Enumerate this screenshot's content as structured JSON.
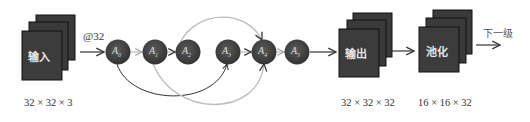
{
  "input_block": {
    "label": "输入",
    "dims": "32 × 32 × 3"
  },
  "input_arrow": {
    "label": "@32"
  },
  "nodes": [
    {
      "id": "A0",
      "base": "A",
      "sub": "0"
    },
    {
      "id": "A1",
      "base": "A",
      "sub": "1"
    },
    {
      "id": "A2",
      "base": "A",
      "sub": "2"
    },
    {
      "id": "A3",
      "base": "A",
      "sub": "3"
    },
    {
      "id": "A4",
      "base": "A",
      "sub": "4"
    },
    {
      "id": "A5",
      "base": "A",
      "sub": "5"
    }
  ],
  "edges": [
    {
      "from": "A0",
      "to": "A1",
      "style": "light-straight"
    },
    {
      "from": "A1",
      "to": "A2",
      "style": "dark-straight"
    },
    {
      "from": "A3",
      "to": "A4",
      "style": "light-straight"
    },
    {
      "from": "A4",
      "to": "A5",
      "style": "light-straight"
    },
    {
      "from": "A2",
      "to": "A4",
      "style": "light-arc-top"
    },
    {
      "from": "A0",
      "to": "A3",
      "style": "dark-arc-bottom"
    },
    {
      "from": "A1",
      "to": "A4",
      "style": "light-arc-bottom"
    }
  ],
  "output_block": {
    "label": "输出",
    "dims": "32 × 32 × 32"
  },
  "pool_block": {
    "label": "池化",
    "dims": "16 × 16 × 32"
  },
  "next_stage": {
    "label": "下一级"
  },
  "colors": {
    "block_fill": "#3a3a3a",
    "block_border": "#1a1a1a",
    "node_fill": "#444444",
    "dark_line": "#333333",
    "light_line": "#bbbbbb",
    "text": "#333333"
  }
}
